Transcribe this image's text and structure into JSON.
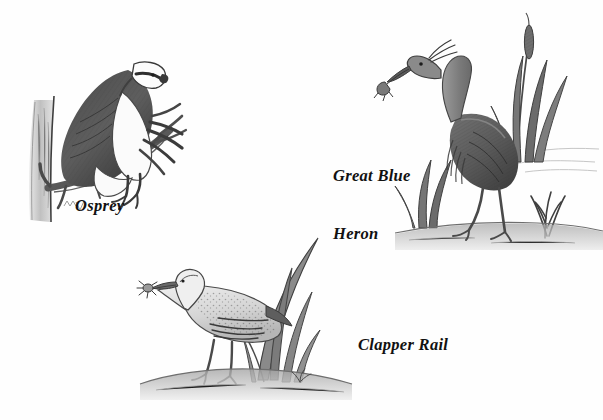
{
  "plate": {
    "medium": "pencil drawing",
    "background_color": "#ffffff",
    "ink_color": "#3a3a3a",
    "text_color": "#111111",
    "width": 603,
    "height": 420
  },
  "figures": [
    {
      "id": "osprey",
      "label": "Osprey",
      "label_lines": [
        "Osprey"
      ],
      "subject": "osprey perched on a broken tree branch",
      "position": "upper-left",
      "elements": [
        "tree-trunk",
        "diagonal-branch",
        "perched-raptor",
        "white-head",
        "dark-back",
        "talons"
      ]
    },
    {
      "id": "great-blue-heron",
      "label": "Great Blue Heron",
      "label_lines": [
        "Great Blue",
        "Heron"
      ],
      "subject": "great blue heron standing in marsh holding prey in its bill",
      "position": "upper-right",
      "elements": [
        "cattails",
        "marsh-grass",
        "shoreline",
        "long-neck",
        "plume-feathers",
        "long-legs",
        "prey-in-bill"
      ]
    },
    {
      "id": "clapper-rail",
      "label": "Clapper Rail",
      "label_lines": [
        "Clapper Rail"
      ],
      "subject": "clapper rail holding a crab in its bill among marsh reeds",
      "position": "bottom-center",
      "elements": [
        "marsh-reeds",
        "mudflat-ground",
        "speckled-back",
        "crab-prey",
        "long-bill"
      ]
    }
  ]
}
